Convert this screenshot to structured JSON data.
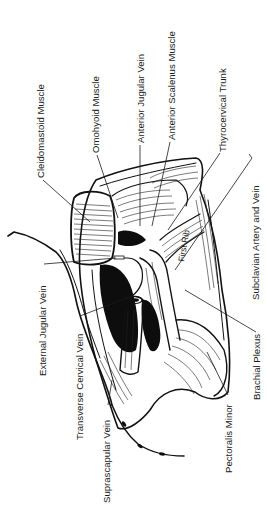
{
  "figure": {
    "orientation_note": "labels rotated 90 degrees counter-clockwise",
    "ink_color": "#111111",
    "background_color": "#ffffff"
  },
  "labels": {
    "cleidomastoid_muscle": "Cleidomastoid Muscle",
    "omohyoid_muscle": "Omohyoid Muscle",
    "anterior_jugular_vein": "Anterior Jugular Vein",
    "anterior_scalenus_muscle": "Anterior Scalenus Muscle",
    "thyrocervical_trunk": "Thyrocervical Trunk",
    "subclavian_artery_and_vein": "Subclavian Artery and Vein",
    "brachial_plexus": "Brachial Plexus",
    "pectoralis_minor": "Pectoralis Minor",
    "suprascapular_vein": "Suprascapular Vein",
    "transverse_cervical_vein": "Transverse Cervical Vein",
    "external_jugular_vein": "External Jugular Vein",
    "first_rib": "First Rib"
  }
}
